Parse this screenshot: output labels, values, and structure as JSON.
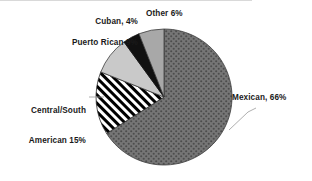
{
  "chart_data": {
    "type": "pie",
    "title": "",
    "subtitle": "",
    "xlabel": "",
    "ylabel": "",
    "legend_position": "none",
    "grid": false,
    "total": 100,
    "units": "percent",
    "start_angle_deg": 0,
    "direction": "clockwise",
    "categories": [
      "Mexican",
      "Central/South American",
      "Puerto Rican",
      "Cuban",
      "Other"
    ],
    "values": [
      66,
      15,
      9,
      4,
      6
    ],
    "slices": [
      {
        "name": "Mexican",
        "value": 66,
        "label": "Mexican, 66%",
        "fill_style": "dotted-gray",
        "fill_color": "#6e6e6e",
        "pattern_color": "#4a4a4a",
        "start_deg": 0,
        "end_deg": 237.6,
        "leader_line": true
      },
      {
        "name": "Central/South American",
        "value": 15,
        "label_line1": "Central/South",
        "label_line2": "American 15%",
        "fill_style": "diagonal-stripes",
        "fill_color": "#ffffff",
        "pattern_color": "#000000",
        "start_deg": 237.6,
        "end_deg": 291.6,
        "leader_line": true
      },
      {
        "name": "Puerto Rican",
        "value": 9,
        "label": "Puerto Rican 9%",
        "fill_style": "light-gray",
        "fill_color": "#c9c9c9",
        "pattern_color": "#c9c9c9",
        "start_deg": 291.6,
        "end_deg": 324.0,
        "leader_line": false
      },
      {
        "name": "Cuban",
        "value": 4,
        "label": "Cuban, 4%",
        "fill_style": "solid-black",
        "fill_color": "#111111",
        "pattern_color": "#111111",
        "start_deg": 324.0,
        "end_deg": 338.4,
        "leader_line": false
      },
      {
        "name": "Other",
        "value": 6,
        "label": "Other 6%",
        "fill_style": "medium-gray",
        "fill_color": "#a8a8a8",
        "pattern_color": "#a8a8a8",
        "start_deg": 338.4,
        "end_deg": 360.0,
        "leader_line": false
      }
    ],
    "labels": {
      "mexican": "Mexican, 66%",
      "central_south_line1": "Central/South",
      "central_south_line2": "American 15%",
      "puerto_rican": "Puerto Rican 9%",
      "cuban": "Cuban, 4%",
      "other": "Other 6%"
    },
    "colors": {
      "mexican": "#6e6e6e",
      "central_south_american": "#000000",
      "puerto_rican": "#c9c9c9",
      "cuban": "#111111",
      "other": "#a8a8a8",
      "outline": "#3c3c3c",
      "background": "#ffffff",
      "text": "#1a1a1a",
      "leader_line": "#8a8a8a",
      "top_rule": "#d9d9d9"
    },
    "geometry": {
      "center_x": 164,
      "center_y": 97,
      "radius": 68
    }
  }
}
